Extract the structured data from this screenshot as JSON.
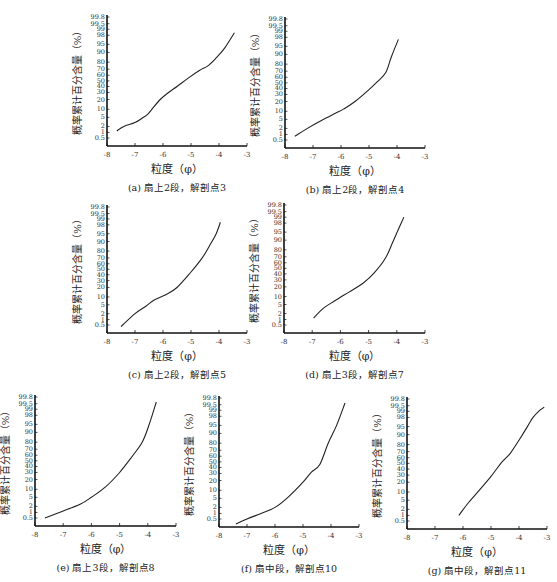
{
  "figure": {
    "y_ticks": [
      99.8,
      99.5,
      99,
      98,
      95,
      90,
      80,
      70,
      60,
      50,
      40,
      30,
      20,
      10,
      5,
      2,
      1,
      0.5
    ],
    "y_tick_labels": [
      "99.8",
      "99.5",
      "99",
      "98",
      "95",
      "90",
      "80",
      "70",
      "60",
      "50",
      "40",
      "30",
      "20",
      "10",
      "5",
      "2",
      "1",
      "0.5"
    ],
    "x_ticks": [
      -8,
      -7,
      -6,
      -5,
      -4,
      -3
    ],
    "x_tick_labels": [
      "-8",
      "-7",
      "-6",
      "-5",
      "-4",
      "-3"
    ],
    "xlabel": "粒度（φ）",
    "ylabel": "概率累计百分含量（%）",
    "line_color": "#222222",
    "axis_color": "#111111"
  },
  "chart_data": [
    {
      "id": "a",
      "type": "line",
      "title": "(a) 扇上2段，解剖点3",
      "xlabel": "粒度（φ）",
      "ylabel": "概率累计百分含量（%）",
      "xlim": [
        -8,
        -3
      ],
      "ylim": [
        0.5,
        99.8
      ],
      "yscale": "probability",
      "panel": {
        "x0": 107,
        "y_top": 15,
        "y_bottom": 146,
        "x_end": 247
      },
      "x": [
        -7.65,
        -7.4,
        -7.0,
        -6.7,
        -6.55,
        -6.4,
        -6.1,
        -5.8,
        -5.5,
        -5.1,
        -4.7,
        -4.4,
        -4.1,
        -3.8,
        -3.45
      ],
      "y": [
        1.2,
        2.0,
        3.0,
        5.0,
        6.5,
        10,
        20,
        30,
        40,
        55,
        68,
        75,
        85,
        93,
        98.5
      ]
    },
    {
      "id": "b",
      "type": "line",
      "title": "(b) 扇上2段，解剖点4",
      "xlabel": "粒度（φ）",
      "ylabel": "概率累计百分含量（%）",
      "xlim": [
        -8,
        -3
      ],
      "ylim": [
        0.5,
        99.8
      ],
      "yscale": "probability",
      "panel": {
        "x0": 285,
        "y_top": 17,
        "y_bottom": 148,
        "x_end": 425
      },
      "x": [
        -7.65,
        -7.2,
        -6.7,
        -6.2,
        -5.9,
        -5.5,
        -5.0,
        -4.7,
        -4.4,
        -4.2,
        -3.95
      ],
      "y": [
        0.8,
        2.0,
        4.5,
        8.5,
        12,
        20,
        38,
        52,
        68,
        88,
        97.5
      ]
    },
    {
      "id": "c",
      "type": "line",
      "title": "(c) 扇上2段，解剖点5",
      "xlabel": "粒度（φ）",
      "ylabel": "概率累计百分含量（%）",
      "xlim": [
        -8,
        -3
      ],
      "ylim": [
        0.5,
        99.8
      ],
      "yscale": "probability",
      "panel": {
        "x0": 107,
        "y_top": 205,
        "y_bottom": 333,
        "x_end": 247
      },
      "x": [
        -7.5,
        -7.0,
        -6.6,
        -6.3,
        -5.9,
        -5.5,
        -5.0,
        -4.6,
        -4.3,
        -4.1,
        -3.95
      ],
      "y": [
        0.4,
        2.0,
        4.5,
        8.0,
        12,
        20,
        45,
        70,
        88,
        95,
        98.5
      ]
    },
    {
      "id": "d",
      "type": "line",
      "title": "(d) 扇上3段，解剖点7",
      "xlabel": "粒度（φ）",
      "ylabel": "概率累计百分含量（%）",
      "xlim": [
        -8,
        -3
      ],
      "ylim": [
        0.5,
        99.8
      ],
      "yscale": "probability",
      "panel": {
        "x0": 284,
        "y_top": 203,
        "y_bottom": 333,
        "x_end": 425
      },
      "x": [
        -6.95,
        -6.6,
        -6.2,
        -5.7,
        -5.2,
        -4.8,
        -4.4,
        -4.15,
        -3.95,
        -3.75
      ],
      "y": [
        1.2,
        3.5,
        7.0,
        14,
        25,
        42,
        68,
        88,
        96,
        99
      ]
    },
    {
      "id": "e",
      "type": "line",
      "title": "(e) 扇上3段，解剖点8",
      "xlabel": "粒度（φ）",
      "ylabel": "概率累计百分含量（%）",
      "xlim": [
        -8,
        -3
      ],
      "ylim": [
        0.5,
        99.8
      ],
      "yscale": "probability",
      "panel": {
        "x0": 35,
        "y_top": 395,
        "y_bottom": 526,
        "x_end": 176
      },
      "x": [
        -7.65,
        -7.0,
        -6.4,
        -6.0,
        -5.5,
        -5.0,
        -4.6,
        -4.2,
        -3.95,
        -3.7
      ],
      "y": [
        0.5,
        1.2,
        2.5,
        5.0,
        12,
        30,
        55,
        80,
        95,
        99.6
      ]
    },
    {
      "id": "f",
      "type": "line",
      "title": "(f) 扇中段，解剖点10",
      "xlabel": "粒度（φ）",
      "ylabel": "概率累计百分含量（%）",
      "xlim": [
        -8,
        -3
      ],
      "ylim": [
        0.5,
        99.8
      ],
      "yscale": "probability",
      "panel": {
        "x0": 219,
        "y_top": 396,
        "y_bottom": 527,
        "x_end": 359
      },
      "x": [
        -7.4,
        -7.0,
        -6.5,
        -6.0,
        -5.5,
        -5.0,
        -4.7,
        -4.4,
        -4.1,
        -3.8,
        -3.5
      ],
      "y": [
        0.25,
        0.5,
        1.0,
        2.0,
        6.0,
        18,
        32,
        45,
        80,
        95,
        99.6
      ]
    },
    {
      "id": "g",
      "type": "line",
      "title": "(g) 扇中段，解剖点11",
      "xlabel": "粒度（φ）",
      "ylabel": "概率累计百分含量（%）",
      "xlim": [
        -8,
        -3
      ],
      "ylim": [
        0.5,
        99.8
      ],
      "yscale": "probability",
      "panel": {
        "x0": 407,
        "y_top": 397,
        "y_bottom": 529,
        "x_end": 547
      },
      "x": [
        -6.15,
        -5.8,
        -5.4,
        -5.0,
        -4.65,
        -4.5,
        -4.3,
        -4.0,
        -3.7,
        -3.5,
        -3.3,
        -3.1
      ],
      "y": [
        1.0,
        4.0,
        12,
        28,
        50,
        58,
        68,
        85,
        95,
        98,
        99,
        99.4
      ]
    }
  ]
}
